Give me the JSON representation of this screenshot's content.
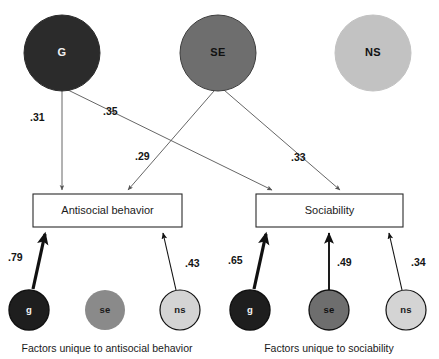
{
  "figure": {
    "type": "path-diagram",
    "width": 439,
    "height": 359
  },
  "latent_factors": [
    {
      "id": "G",
      "label": "G",
      "fill": "#2b2b2b",
      "text_color": "#f2f2f2",
      "cx": 62,
      "cy": 53,
      "r": 38,
      "stroke": "#2b2b2b"
    },
    {
      "id": "SE",
      "label": "SE",
      "fill": "#6e6e6e",
      "text_color": "#111111",
      "cx": 218,
      "cy": 53,
      "r": 38,
      "stroke": "#3d3d3d"
    },
    {
      "id": "NS",
      "label": "NS",
      "fill": "#c2c2c2",
      "text_color": "#111111",
      "cx": 373,
      "cy": 53,
      "r": 38,
      "stroke": "#c2c2c2"
    }
  ],
  "observed_variables": [
    {
      "id": "antisocial",
      "label": "Antisocial behavior",
      "x": 33,
      "y": 194,
      "width": 149,
      "height": 33
    },
    {
      "id": "sociability",
      "label": "Sociability",
      "x": 256,
      "y": 194,
      "width": 147,
      "height": 33
    }
  ],
  "structural_paths": [
    {
      "from": "G",
      "to": "antisocial",
      "coefficient": ".31",
      "label_x": 30,
      "label_y": 118
    },
    {
      "from": "G",
      "to": "sociability",
      "coefficient": ".35",
      "label_x": 103,
      "label_y": 112
    },
    {
      "from": "SE",
      "to": "antisocial",
      "coefficient": ".29",
      "label_x": 135,
      "label_y": 157
    },
    {
      "from": "SE",
      "to": "sociability",
      "coefficient": ".33",
      "label_x": 291,
      "label_y": 158
    }
  ],
  "residual_factors": [
    {
      "id": "g-left",
      "label": "g",
      "fill": "#1e1e1e",
      "text_color": "#f5f5f5",
      "cx": 29,
      "cy": 310,
      "r": 20,
      "stroke": "#111111",
      "outlined": true,
      "coefficient": ".79",
      "weight": "thick",
      "label_x": 8,
      "label_y": 258
    },
    {
      "id": "se-left",
      "label": "se",
      "fill": "#8a8a8a",
      "text_color": "#1a1a1a",
      "cx": 105,
      "cy": 310,
      "r": 20,
      "stroke": "#8a8a8a",
      "outlined": false,
      "coefficient": "",
      "weight": "none",
      "label_x": 0,
      "label_y": 0
    },
    {
      "id": "ns-left",
      "label": "ns",
      "fill": "#d4d4d4",
      "text_color": "#1a1a1a",
      "cx": 180,
      "cy": 310,
      "r": 20,
      "stroke": "#111111",
      "outlined": true,
      "coefficient": ".43",
      "weight": "thin",
      "label_x": 185,
      "label_y": 264
    },
    {
      "id": "g-right",
      "label": "g",
      "fill": "#1e1e1e",
      "text_color": "#f5f5f5",
      "cx": 250,
      "cy": 310,
      "r": 20,
      "stroke": "#111111",
      "outlined": true,
      "coefficient": ".65",
      "weight": "thick",
      "label_x": 228,
      "label_y": 261
    },
    {
      "id": "se-right",
      "label": "se",
      "fill": "#6e6e6e",
      "text_color": "#111111",
      "cx": 329,
      "cy": 310,
      "r": 20,
      "stroke": "#111111",
      "outlined": true,
      "coefficient": ".49",
      "weight": "medium",
      "label_x": 337,
      "label_y": 263
    },
    {
      "id": "ns-right",
      "label": "ns",
      "fill": "#d4d4d4",
      "text_color": "#1a1a1a",
      "cx": 406,
      "cy": 310,
      "r": 20,
      "stroke": "#111111",
      "outlined": true,
      "coefficient": ".34",
      "weight": "thin",
      "label_x": 411,
      "label_y": 263
    }
  ],
  "captions": [
    {
      "id": "caption-left",
      "text": "Factors unique to antisocial behavior",
      "x": 107,
      "y": 349
    },
    {
      "id": "caption-right",
      "text": "Factors unique to sociability",
      "x": 329,
      "y": 349
    }
  ]
}
